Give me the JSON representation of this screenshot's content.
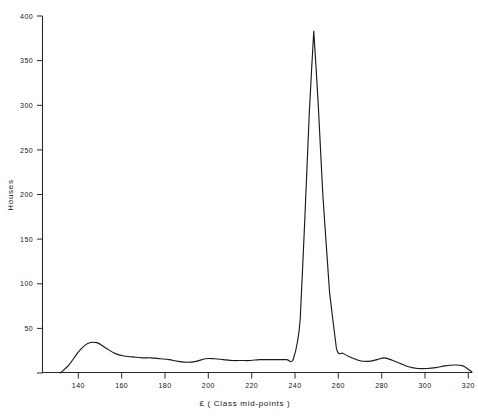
{
  "chart_data": {
    "type": "line",
    "title": "",
    "subtitle": "",
    "xlabel": "£  ( Class mid-points )",
    "ylabel": "Houses",
    "xlim": [
      130,
      320
    ],
    "ylim": [
      0,
      400
    ],
    "xticks": [
      140,
      160,
      180,
      200,
      220,
      240,
      260,
      280,
      300,
      320
    ],
    "yticks": [
      50,
      100,
      150,
      200,
      250,
      300,
      350,
      400
    ],
    "xtick_labels": [
      "140",
      "160",
      "180",
      "200",
      "220",
      "240",
      "260",
      "280",
      "300",
      "320"
    ],
    "ytick_labels": [
      "50",
      "100",
      "150",
      "200",
      "250",
      "300",
      "350",
      "400"
    ],
    "grid": false,
    "legend": false,
    "legend_position": "none",
    "series": [
      {
        "name": "Houses",
        "x": [
          138,
          142,
          146,
          150,
          154,
          158,
          162,
          166,
          170,
          174,
          178,
          182,
          186,
          190,
          194,
          198,
          202,
          206,
          210,
          214,
          218,
          222,
          226,
          230,
          234,
          238,
          241,
          244,
          246,
          248,
          250,
          252,
          254,
          257,
          260,
          263,
          266,
          270,
          274,
          278,
          281,
          284,
          288,
          292,
          296,
          300,
          304,
          308,
          312,
          316,
          320
        ],
        "y": [
          0,
          10,
          24,
          33,
          34,
          28,
          22,
          19,
          18,
          17,
          17,
          16,
          15,
          13,
          12,
          13,
          16,
          16,
          15,
          14,
          14,
          14,
          15,
          15,
          15,
          15,
          16,
          60,
          170,
          290,
          383,
          300,
          200,
          90,
          28,
          22,
          18,
          14,
          13,
          15,
          17,
          15,
          11,
          7,
          5,
          5,
          6,
          8,
          9,
          8,
          1
        ]
      }
    ],
    "annotations": [],
    "peak": {
      "x": 250,
      "y": 383
    },
    "secondary_peaks": [
      {
        "x": 152,
        "y": 34
      },
      {
        "x": 200,
        "y": 16
      },
      {
        "x": 281,
        "y": 17
      },
      {
        "x": 312,
        "y": 9
      }
    ],
    "colors": {
      "line": "#1a1a1a",
      "axis": "#2a2a2a",
      "background": "#ffffff",
      "text": "#151515"
    }
  }
}
